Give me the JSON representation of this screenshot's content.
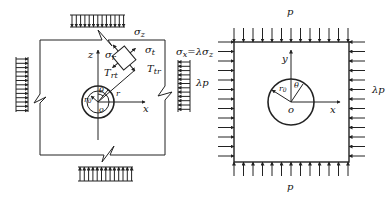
{
  "left_figure": {
    "title": "Deep-buried circular tunnel under non-uniform in-situ stress (cross-section)",
    "labels": {
      "sigma_vertical": "σ",
      "sigma_vertical_sub": "z",
      "sigma_horizontal": "σ",
      "sigma_horizontal_sub": "x",
      "sigma_horizontal_eq": "=λσ",
      "sigma_horizontal_eq_sub": "z",
      "z_axis": "z",
      "x_axis": "x",
      "sigma_r": "σ",
      "sigma_r_sub": "r",
      "sigma_t": "σ",
      "sigma_t_sub": "t",
      "tau_rt": "T",
      "tau_rt_sub": "rt",
      "tau_tr": "T",
      "tau_tr_sub": "tr",
      "radius_r": "r",
      "radius_r0": "r",
      "radius_r0_sub": "0",
      "angle": "θ",
      "origin": "o"
    }
  },
  "right_figure": {
    "title": "Plate with circular hole under biaxial pressure",
    "labels": {
      "top_load": "p",
      "bottom_load": "p",
      "left_load": "λp",
      "right_load": "λp",
      "y_axis": "y",
      "x_axis": "x",
      "radius_r0": "r",
      "radius_r0_sub": "0",
      "angle": "θ",
      "origin": "o"
    }
  }
}
